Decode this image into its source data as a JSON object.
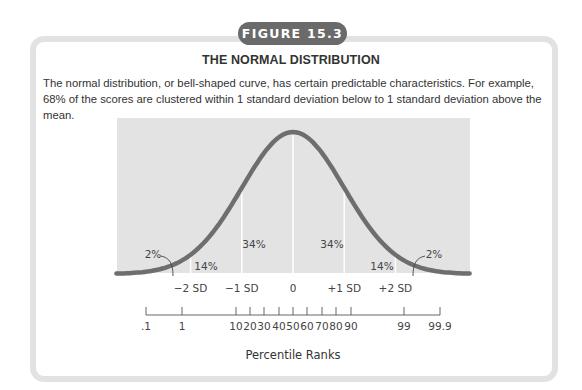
{
  "figure": {
    "badge": "FIGURE 15.3",
    "title": "THE NORMAL DISTRIBUTION",
    "description": "The normal distribution, or bell-shaped curve, has certain predictable characteristics. For example, 68% of the scores are clustered within 1 standard deviation below to 1 standard deviation above the mean."
  },
  "colors": {
    "panel": "#e3e3e3",
    "curve": "#6e6e6e",
    "divider": "#ffffff",
    "frame": "#e2e2e2",
    "badge": "#6a6a6a"
  },
  "chart_data": {
    "type": "area",
    "title": "THE NORMAL DISTRIBUTION",
    "xlabel": "Percentile Ranks",
    "ylabel": "",
    "distribution": {
      "mean": 0,
      "sd": 1
    },
    "xlim": [
      -3.45,
      3.45
    ],
    "grid": false,
    "sd_labels": [
      "−2 SD",
      "−1 SD",
      "0",
      "+1 SD",
      "+2 SD"
    ],
    "sd_values": [
      -2,
      -1,
      0,
      1,
      2
    ],
    "regions": [
      {
        "from": "-inf",
        "to": -2,
        "label": "2%"
      },
      {
        "from": -2,
        "to": -1,
        "label": "14%"
      },
      {
        "from": -1,
        "to": 0,
        "label": "34%"
      },
      {
        "from": 0,
        "to": 1,
        "label": "34%"
      },
      {
        "from": 1,
        "to": 2,
        "label": "14%"
      },
      {
        "from": 2,
        "to": "inf",
        "label": "2%"
      }
    ],
    "percentile_ticks": [
      ".1",
      "1",
      "10",
      "20",
      "30",
      "40",
      "50",
      "60",
      "70",
      "80",
      "90",
      "99",
      "99.9"
    ],
    "percentile_values": [
      0.1,
      1,
      10,
      20,
      30,
      40,
      50,
      60,
      70,
      80,
      90,
      99,
      99.9
    ]
  }
}
